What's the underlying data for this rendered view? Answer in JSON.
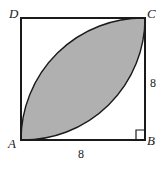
{
  "figure": {
    "name": "square-with-shaded-lens",
    "colors": {
      "shade_fill": "#b0b0b0",
      "stroke": "#1a1a1a",
      "background": "#ffffff"
    },
    "square": {
      "side_length_label": "8",
      "vertices": [
        {
          "id": "D",
          "label": "D",
          "position": "top-left"
        },
        {
          "id": "C",
          "label": "C",
          "position": "top-right"
        },
        {
          "id": "A",
          "label": "A",
          "position": "bottom-left"
        },
        {
          "id": "B",
          "label": "B",
          "position": "bottom-right"
        }
      ]
    },
    "dimension_labels": [
      {
        "id": "side-right",
        "value": "8",
        "edge": "BC",
        "placement": "right-outside"
      },
      {
        "id": "side-bottom",
        "value": "8",
        "edge": "AB",
        "placement": "bottom-outside"
      }
    ],
    "markers": [
      {
        "id": "right-angle-B",
        "type": "right-angle-square",
        "at_vertex": "B"
      }
    ],
    "shaded_region": {
      "type": "lens",
      "endpoints": [
        "A",
        "C"
      ],
      "arc_centers": [
        "D",
        "B"
      ],
      "arc_radius_label": "8"
    }
  }
}
